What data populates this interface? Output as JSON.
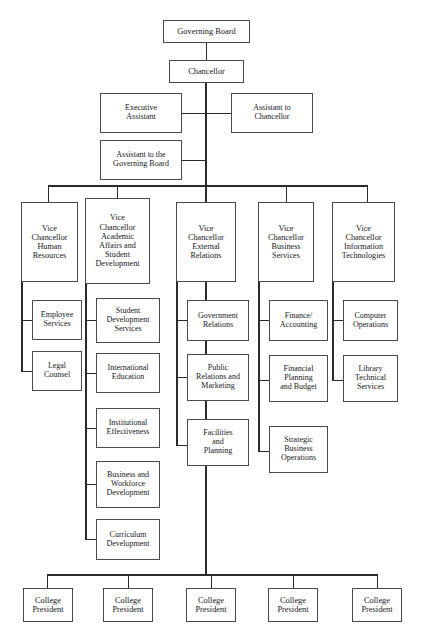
{
  "diagram": {
    "type": "organization-chart",
    "orientation": "top-down",
    "line_color": "#2b2b2b",
    "box_border_color": "#4a4a4a",
    "background_color": "#ffffff"
  },
  "nodes": {
    "governing_board": "Governing Board",
    "chancellor": "Chancellor",
    "executive_assistant": "Executive\nAssistant",
    "assistant_to_chancellor": "Assistant to\nChancellor",
    "assistant_to_governing_board": "Assistant to the\nGoverning Board"
  },
  "divisions": [
    {
      "id": "human-resources",
      "title": "Vice\nChancellor\nHuman\nResources",
      "departments": [
        "Employee\nServices",
        "Legal\nCounsel"
      ]
    },
    {
      "id": "academic-affairs-student-development",
      "title": "Vice\nChancellor\nAcademic\nAffairs and\nStudent\nDevelopment",
      "departments": [
        "Student\nDevelopment\nServices",
        "International\nEducation",
        "Institutional\nEffectiveness",
        "Business and\nWorkforce\nDevelopment",
        "Curriculum\nDevelopment"
      ]
    },
    {
      "id": "external-relations",
      "title": "Vice\nChancellor\nExternal\nRelations",
      "departments": [
        "Government\nRelations",
        "Public\nRelations and\nMarketing",
        "Facilities\nand\nPlanning"
      ]
    },
    {
      "id": "business-services",
      "title": "Vice\nChancellor\nBusiness\nServices",
      "departments": [
        "Finance/\nAccounting",
        "Financial\nPlanning\nand Budget",
        "Strategic\nBusiness\nOperations"
      ]
    },
    {
      "id": "information-technologies",
      "title": "Vice\nChancellor\nInformation\nTechnologies",
      "departments": [
        "Computer\nOperations",
        "Library\nTechnical\nServices"
      ]
    }
  ],
  "colleges": [
    "College\nPresident",
    "College\nPresident",
    "College\nPresident",
    "College\nPresident",
    "College\nPresident"
  ]
}
